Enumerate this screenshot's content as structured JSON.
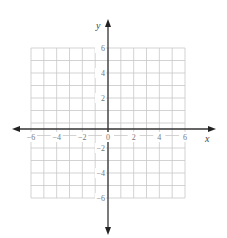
{
  "chart_data": {
    "type": "scatter",
    "title": "",
    "xlabel": "x",
    "ylabel": "y",
    "xlim": [
      -6,
      6
    ],
    "ylim": [
      -6,
      6
    ],
    "grid": true,
    "grid_step": 1,
    "x_ticks": [
      -6,
      -4,
      -2,
      0,
      2,
      4,
      6
    ],
    "y_ticks": [
      6,
      4,
      2,
      -2,
      -4,
      -6
    ],
    "x_tick_labels": [
      "−6",
      "−4",
      "−2",
      "0",
      "2",
      "4",
      "6"
    ],
    "y_tick_labels": [
      "6",
      "4",
      "2",
      "−2",
      "−4",
      "−6"
    ],
    "series": [],
    "legend": null
  },
  "colors": {
    "grid": "#c8c8c8",
    "axis": "#333333",
    "tick_text": "#777777"
  }
}
